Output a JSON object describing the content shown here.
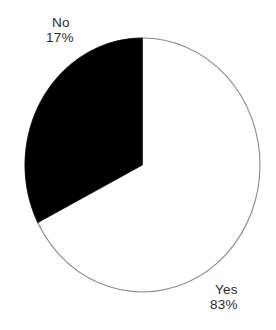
{
  "figure": {
    "width": 276,
    "height": 330,
    "background_color": "#ffffff"
  },
  "chart_data": {
    "type": "pie",
    "title": "",
    "subtitle": "",
    "xlabel": "",
    "ylabel": "",
    "legend_position": "none",
    "grid": false,
    "labels": [
      "No",
      "Yes"
    ],
    "values": [
      17,
      83
    ],
    "value_unit": "%",
    "slices": [
      {
        "label": "No",
        "value": 17,
        "value_text": "17%",
        "fill_color": "#000000",
        "label_position": "outside-top-left"
      },
      {
        "label": "Yes",
        "value": 83,
        "value_text": "83%",
        "fill_color": "#ffffff",
        "label_position": "outside-bottom-right"
      }
    ],
    "annotations": [],
    "geometry": {
      "center_x": 142.5,
      "center_y": 165,
      "radius_x": 117.5,
      "radius_y": 127,
      "start_angle_deg": 0,
      "direction": "counterclockwise",
      "outline_color": "#8c8c8c",
      "outline_width": 1
    }
  },
  "labels": {
    "no": {
      "name": "No",
      "value_text": "17%"
    },
    "yes": {
      "name": "Yes",
      "value_text": "83%"
    }
  }
}
